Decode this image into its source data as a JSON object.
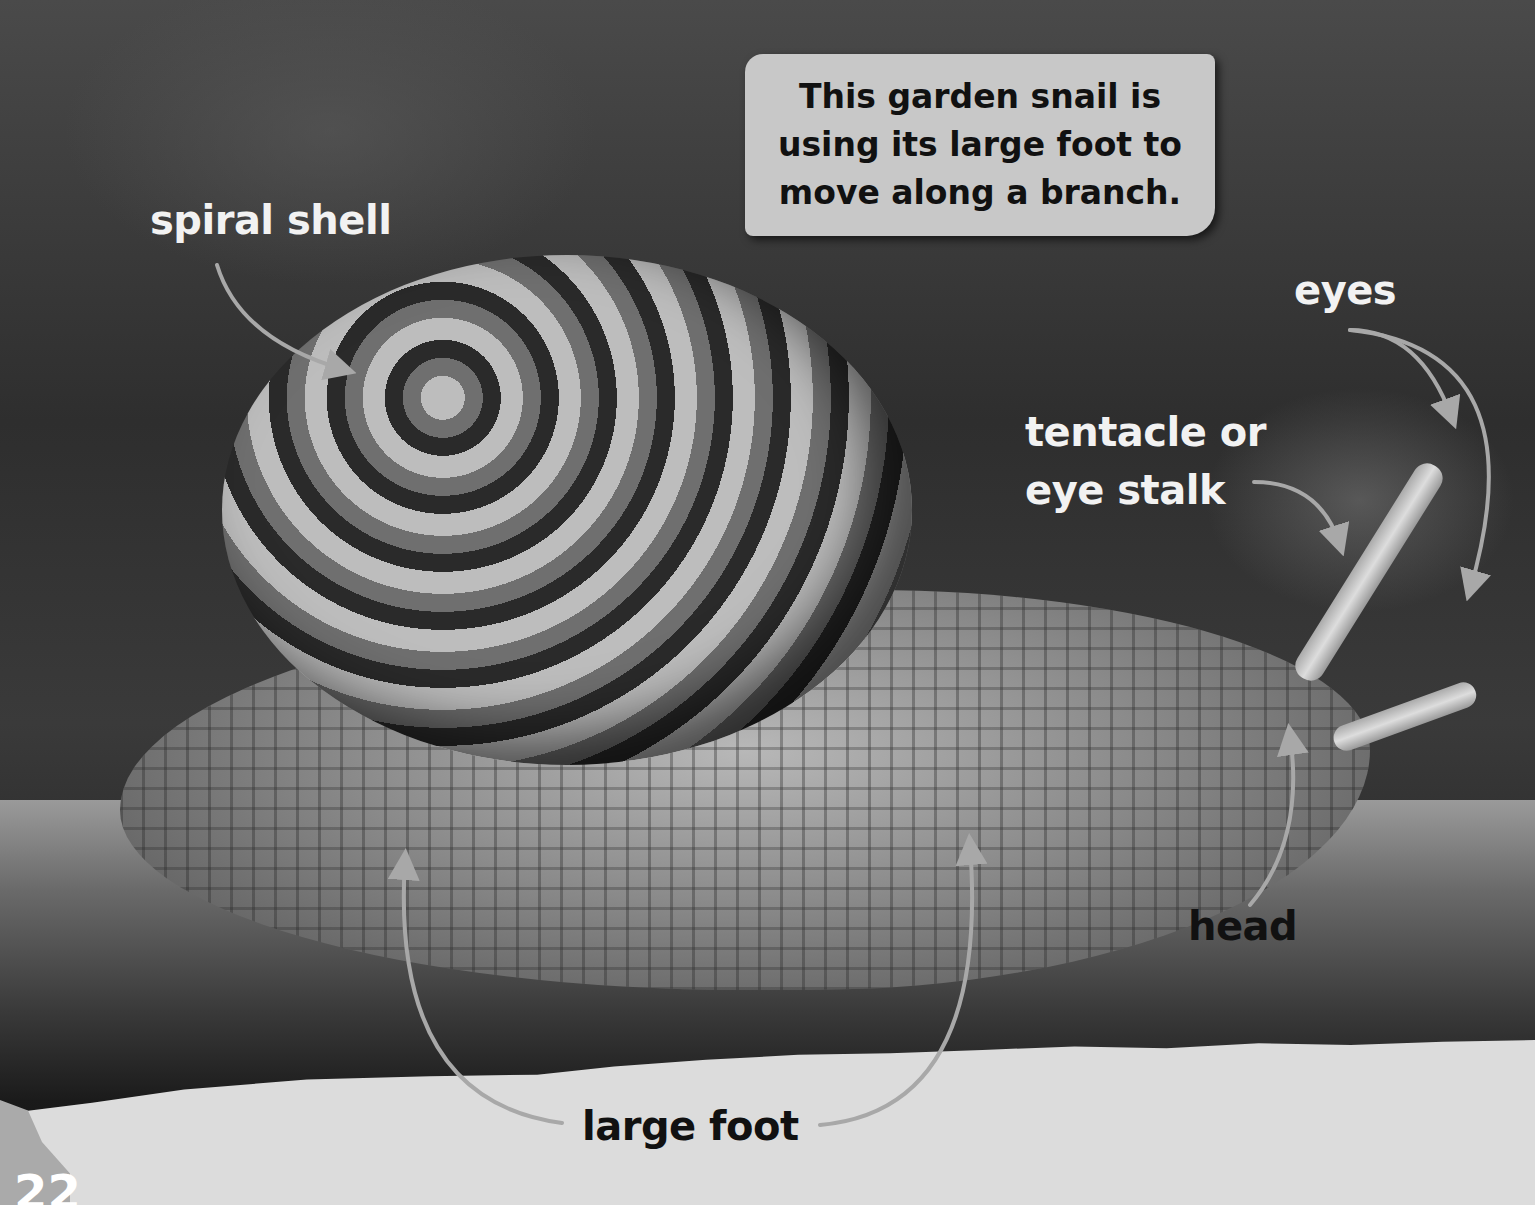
{
  "page": {
    "page_number": "22",
    "caption": "This garden snail is using its large foot to move along a branch."
  },
  "labels": {
    "spiral_shell": "spiral shell",
    "eyes": "eyes",
    "tentacle": "tentacle or eye stalk",
    "tentacle_line1": "tentacle or",
    "tentacle_line2": "eye stalk",
    "head": "head",
    "large_foot": "large foot"
  },
  "colors": {
    "caption_bg": "#c8c8c8",
    "label_light": "#f2f2f2",
    "label_dark": "#111111",
    "arrow": "#a8a8a8",
    "torn_strip": "#dcdcdc"
  }
}
